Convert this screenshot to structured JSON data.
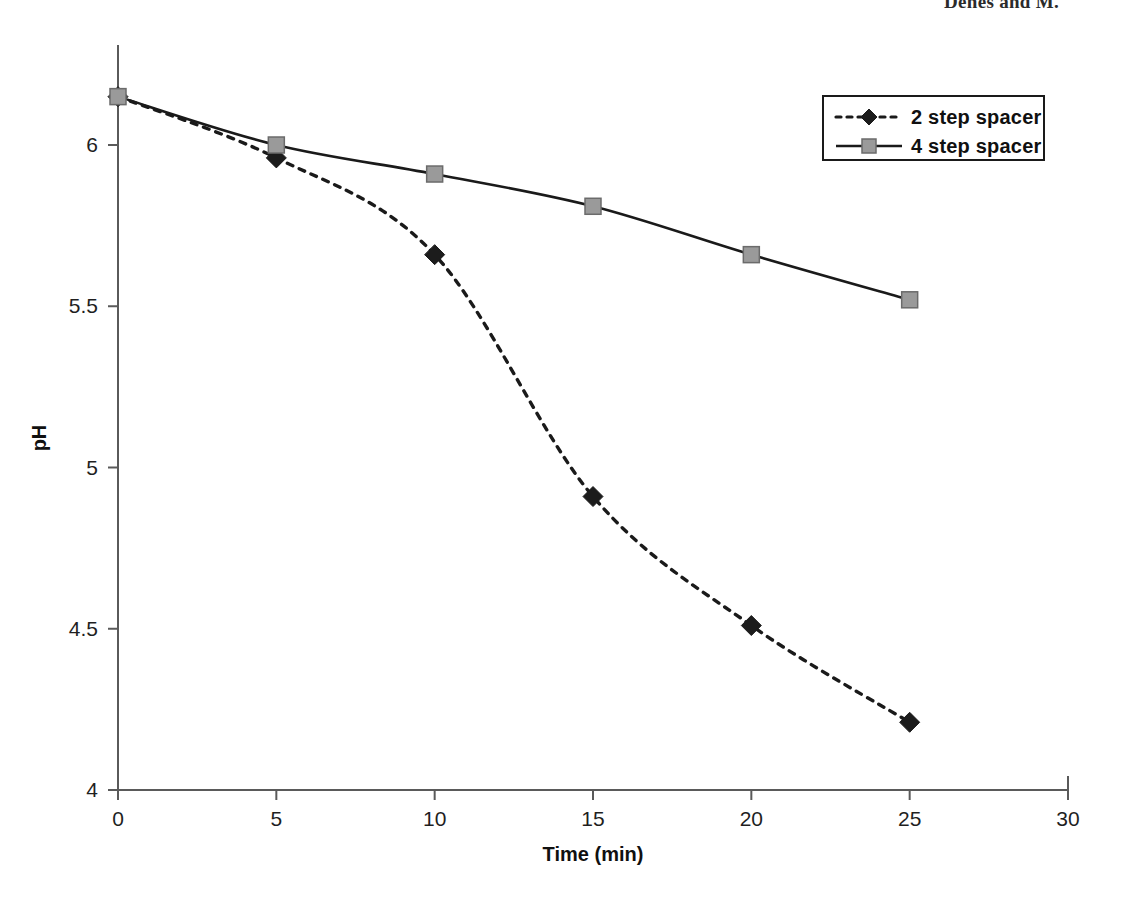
{
  "page": {
    "running_header": "Denes and M."
  },
  "chart_data": {
    "type": "line",
    "title": "",
    "xlabel": "Time (min)",
    "ylabel": "pH",
    "xlim": [
      0,
      30
    ],
    "ylim": [
      4,
      6.25
    ],
    "xticks": [
      "0",
      "5",
      "10",
      "15",
      "20",
      "25",
      "30"
    ],
    "xtick_values": [
      0,
      5,
      10,
      15,
      20,
      25,
      30
    ],
    "yticks": [
      "4",
      "4.5",
      "5",
      "5.5",
      "6"
    ],
    "ytick_values": [
      4,
      4.5,
      5,
      5.5,
      6
    ],
    "grid": false,
    "legend_position": "top-right",
    "x": [
      0,
      5,
      10,
      15,
      20,
      25
    ],
    "series": [
      {
        "name": "2 step spacer",
        "marker": "diamond",
        "linestyle": "dashed",
        "color": "#1c1c1c",
        "values": [
          6.15,
          5.96,
          5.66,
          4.91,
          4.51,
          4.21
        ]
      },
      {
        "name": "4 step spacer",
        "marker": "square",
        "linestyle": "solid",
        "color": "#1a1a1a",
        "values": [
          6.15,
          6.0,
          5.91,
          5.81,
          5.66,
          5.52
        ]
      }
    ]
  },
  "legend": {
    "items": [
      {
        "label": "2 step spacer"
      },
      {
        "label": "4 step spacer"
      }
    ]
  }
}
